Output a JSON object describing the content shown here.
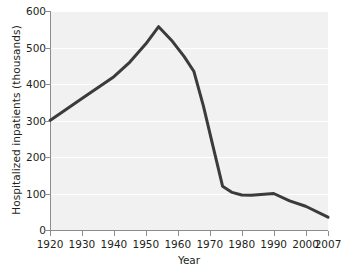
{
  "chart_data": {
    "type": "line",
    "title": "",
    "xlabel": "Year",
    "ylabel": "Hospitalized inpatients (thousands)",
    "xlim": [
      1920,
      2007
    ],
    "ylim": [
      0,
      600
    ],
    "grid": true,
    "legend": null,
    "xticks": [
      1920,
      1930,
      1940,
      1950,
      1960,
      1970,
      1980,
      1990,
      2000,
      2007
    ],
    "xtick_labels": [
      "1920",
      "1930",
      "1940",
      "1950",
      "1960",
      "1970",
      "1980",
      "1990",
      "2000",
      "2007"
    ],
    "yticks": [
      0,
      100,
      200,
      300,
      400,
      500,
      600
    ],
    "ytick_labels": [
      "0",
      "100",
      "200",
      "300",
      "400",
      "500",
      "600"
    ],
    "series": [
      {
        "name": "Hospitalized inpatients",
        "color": "#3b3b3b",
        "x": [
          1920,
          1930,
          1940,
          1945,
          1950,
          1954,
          1958,
          1962,
          1965,
          1968,
          1971,
          1974,
          1977,
          1980,
          1983,
          1986,
          1990,
          1995,
          2000,
          2007
        ],
        "values": [
          300,
          360,
          420,
          460,
          510,
          557,
          520,
          475,
          435,
          340,
          230,
          120,
          103,
          96,
          95,
          97,
          100,
          80,
          65,
          35
        ]
      }
    ]
  }
}
